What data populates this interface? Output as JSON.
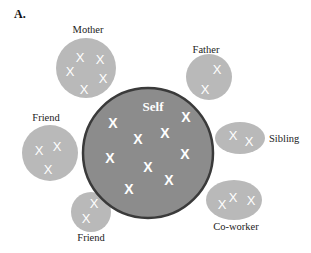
{
  "panel": {
    "label": "A."
  },
  "colors": {
    "self_fill": "#8c8c8c",
    "self_border": "#3a3a3a",
    "other_fill": "#b9b9b9",
    "mark": "#ffffff",
    "text": "#222222"
  },
  "self": {
    "label": "Self",
    "mark": "X",
    "mark_count": 10
  },
  "nodes": [
    {
      "id": "mother",
      "label": "Mother",
      "mark": "X",
      "mark_count": 5
    },
    {
      "id": "father",
      "label": "Father",
      "mark": "X",
      "mark_count": 2
    },
    {
      "id": "friend-left",
      "label": "Friend",
      "mark": "X",
      "mark_count": 3
    },
    {
      "id": "friend-bottom",
      "label": "Friend",
      "mark": "X",
      "mark_count": 2
    },
    {
      "id": "sibling",
      "label": "Sibling",
      "mark": "X",
      "mark_count": 2
    },
    {
      "id": "coworker",
      "label": "Co-worker",
      "mark": "X",
      "mark_count": 3
    }
  ]
}
